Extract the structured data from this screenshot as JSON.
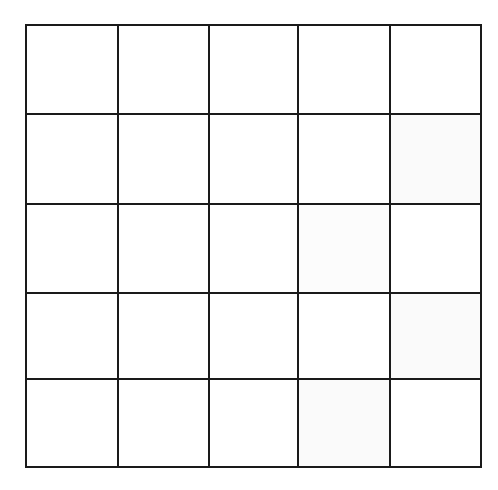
{
  "diagram": {
    "type": "grid",
    "rows": 5,
    "cols": 5,
    "line_color": "#1a1a1a",
    "background": "#ffffff",
    "line_width": 2,
    "x_lines": [
      26,
      118,
      209,
      298,
      390,
      481
    ],
    "y_lines": [
      25,
      114,
      204,
      293,
      379,
      467
    ],
    "cells_fill": [
      [
        "#ffffff",
        "#ffffff",
        "#ffffff",
        "#ffffff",
        "#ffffff"
      ],
      [
        "#ffffff",
        "#ffffff",
        "#ffffff",
        "#ffffff",
        "#fafafa"
      ],
      [
        "#ffffff",
        "#ffffff",
        "#ffffff",
        "#fcfcfc",
        "#ffffff"
      ],
      [
        "#ffffff",
        "#ffffff",
        "#ffffff",
        "#ffffff",
        "#fafafa"
      ],
      [
        "#ffffff",
        "#ffffff",
        "#ffffff",
        "#fafafa",
        "#ffffff"
      ]
    ]
  }
}
